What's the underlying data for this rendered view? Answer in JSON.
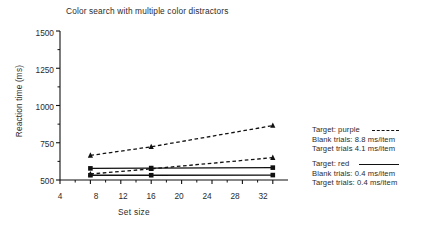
{
  "chart_data": {
    "type": "line",
    "title": "Color search with multiple color distractors",
    "xlabel": "Set size",
    "ylabel": "Reaction time (ms)",
    "x": [
      8,
      16,
      32
    ],
    "xlim": [
      4,
      34
    ],
    "ylim": [
      500,
      1500
    ],
    "xticks": [
      4,
      8,
      12,
      16,
      20,
      24,
      28,
      32
    ],
    "yticks": [
      500,
      750,
      1000,
      1250,
      1500
    ],
    "grid": false,
    "legend_position": "right",
    "series": [
      {
        "name": "Target: purple — Blank trials",
        "values": [
          665,
          723,
          865
        ],
        "marker": "triangle",
        "linestyle": "dashed",
        "color": "#111111"
      },
      {
        "name": "Target: purple — Target trials",
        "values": [
          540,
          575,
          650
        ],
        "marker": "triangle",
        "linestyle": "dashed",
        "color": "#111111"
      },
      {
        "name": "Target: red — Blank trials",
        "values": [
          578,
          580,
          583
        ],
        "marker": "square",
        "linestyle": "solid",
        "color": "#111111"
      },
      {
        "name": "Target: red — Target trials",
        "values": [
          532,
          532,
          533
        ],
        "marker": "square",
        "linestyle": "solid",
        "color": "#111111"
      }
    ]
  },
  "legend": {
    "purple": {
      "title": "Target: purple",
      "line_style": "dashed",
      "blank": "Blank trials: 8.8 ms/item",
      "target": "Target trials 4.1 ms/item"
    },
    "red": {
      "title": "Target: red",
      "line_style": "solid",
      "blank": "Blank trials: 0.4 ms/item",
      "target": "Target trials: 0.4 ms/item"
    }
  }
}
